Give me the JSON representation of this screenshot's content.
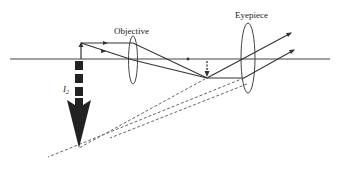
{
  "diagram": {
    "labels": {
      "objective": "Objective",
      "eyepiece": "Eyepiece",
      "image_label_main": "I",
      "image_label_sub": "2"
    },
    "elements": {
      "optical_axis": {
        "x1": 10,
        "y1": 59,
        "x2": 330,
        "y2": 59
      },
      "object_arrow": {
        "x": 81,
        "y_base": 59,
        "y_tip": 43
      },
      "objective_lens": {
        "cx": 133,
        "cy": 60,
        "rx": 4.5,
        "ry": 24
      },
      "eyepiece_lens": {
        "cx": 248,
        "cy": 58,
        "rx": 7,
        "ry": 35
      },
      "intermediate_image": {
        "x": 207,
        "y_base": 59,
        "y_tip": 77
      },
      "final_image": {
        "x": 79,
        "y_base": 62,
        "y_tip": 150
      },
      "focal_points": [
        {
          "x": 105,
          "y": 43
        },
        {
          "x": 188,
          "y": 59
        },
        {
          "x": 105,
          "y": 52
        }
      ]
    },
    "colors": {
      "line": "#333333",
      "arrow_fill": "#222222",
      "dashed": "#666666",
      "background": "#ffffff"
    }
  }
}
